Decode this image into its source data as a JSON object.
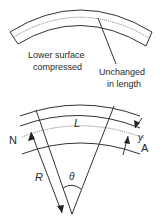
{
  "top_diagram": {
    "labels": {
      "lower_surface_line1": "Lower surface",
      "lower_surface_line2": "compressed",
      "unchanged_line1": "Unchanged",
      "unchanged_line2": "in length"
    }
  },
  "bottom_diagram": {
    "labels": {
      "length": "L",
      "neutral": "N",
      "offset": "y",
      "point_a": "A",
      "radius": "R",
      "angle": "θ"
    }
  },
  "colors": {
    "stroke": "#333333",
    "text": "#2a2a2a",
    "background": "#ffffff"
  }
}
